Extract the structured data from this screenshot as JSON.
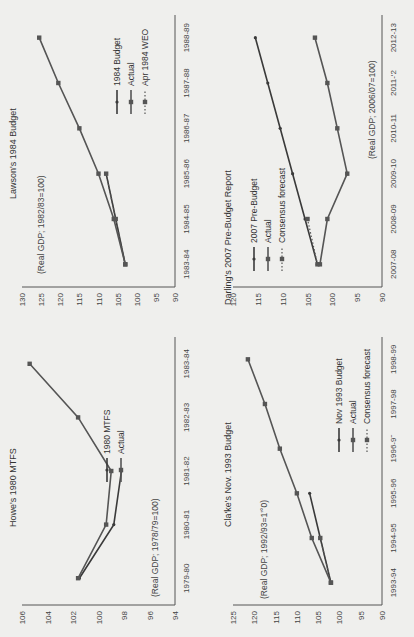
{
  "colors": {
    "line_dark": "#3a3a3a",
    "line_mid": "#555555",
    "axis": "#555555",
    "background": "#efefed"
  },
  "chart_data": [
    {
      "id": "howe",
      "type": "line",
      "title": "Howe's 1980 MTFS",
      "note": "(Real GDP; 1978/79=100)",
      "categories": [
        "1979-80",
        "1980-81",
        "1981-82",
        "1982-83",
        "1983-84"
      ],
      "ylim": [
        94,
        106
      ],
      "yticks": [
        94,
        96,
        98,
        100,
        102,
        104,
        106
      ],
      "legend_position": "right",
      "series": [
        {
          "name": "1980 MTFS",
          "marker": "tick",
          "values": [
            101.5,
            98.8,
            98.2,
            null,
            null
          ]
        },
        {
          "name": "Actual",
          "marker": "square",
          "values": [
            101.6,
            99.4,
            99.0,
            101.6,
            105.4
          ]
        }
      ]
    },
    {
      "id": "lawson",
      "type": "line",
      "title": "Lawson's 1984 Budget",
      "note": "(Real GDP; 1982/83=100)",
      "categories": [
        "1983-84",
        "1984-85",
        "1985-86",
        "1986-87",
        "1987-88",
        "1988-89"
      ],
      "ylim": [
        90,
        130
      ],
      "yticks": [
        90,
        95,
        100,
        105,
        110,
        115,
        120,
        125,
        130
      ],
      "legend_position": "right",
      "series": [
        {
          "name": "1984 Budget",
          "marker": "tick",
          "values": [
            103.0,
            105.5,
            108.0,
            null,
            null,
            null
          ]
        },
        {
          "name": "Actual",
          "marker": "square",
          "values": [
            103.0,
            106.0,
            110.0,
            115.0,
            120.5,
            125.5
          ]
        },
        {
          "name": "Apr 1984 WEO",
          "marker": "square-dotted",
          "values": [
            103.0,
            105.5,
            108.0,
            null,
            null,
            null
          ]
        }
      ]
    },
    {
      "id": "clarke",
      "type": "line",
      "title": "Cla'ke's Nov. 1993 Budget",
      "note": "(Real GDP; 1992/93=1’°0)",
      "categories": [
        "1993-94",
        "1994-95",
        "1995-96",
        "1996-9˜",
        "1997-98",
        "1998-99"
      ],
      "ylim": [
        90,
        125
      ],
      "yticks": [
        90,
        95,
        100,
        105,
        110,
        115,
        120,
        125
      ],
      "legend_position": "right",
      "series": [
        {
          "name": "Nov 1993 Budget",
          "marker": "tick",
          "values": [
            102.0,
            104.5,
            107.0,
            null,
            null,
            null
          ]
        },
        {
          "name": "Actual",
          "marker": "square",
          "values": [
            102.0,
            106.5,
            110.0,
            114.0,
            117.5,
            121.5
          ]
        },
        {
          "name": "Consensus forecast",
          "marker": "square-dotted",
          "values": [
            102.0,
            104.5,
            null,
            null,
            null,
            null
          ]
        }
      ]
    },
    {
      "id": "darling",
      "type": "line",
      "title": "Darling's 2007 Pre-Budget Report",
      "note": "(Real GDP; 2006/07=100)",
      "categories": [
        "2007-08",
        "2008-09",
        "2009-10",
        "2010-11",
        "2011-‘2",
        "2012-13"
      ],
      "ylim": [
        90,
        120
      ],
      "yticks": [
        90,
        95,
        100,
        105,
        110,
        115,
        120
      ],
      "legend_position": "left",
      "series": [
        {
          "name": "2007 Pre-Budget",
          "marker": "tick",
          "values": [
            103.0,
            105.5,
            108.0,
            110.5,
            113.0,
            115.5
          ]
        },
        {
          "name": "Actual",
          "marker": "square",
          "values": [
            102.5,
            101.0,
            97.0,
            99.0,
            101.0,
            103.5
          ]
        },
        {
          "name": "Consensus forecast",
          "marker": "square-dotted",
          "values": [
            103.0,
            105.0,
            null,
            null,
            null,
            null
          ]
        }
      ]
    }
  ]
}
